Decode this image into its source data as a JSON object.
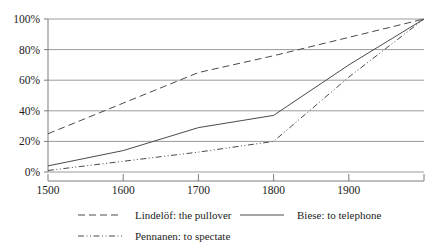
{
  "chart_data": {
    "type": "line",
    "title": "",
    "subtitle": "",
    "xlabel": "",
    "ylabel": "",
    "x": [
      1500,
      1600,
      1700,
      1800,
      1900,
      2000
    ],
    "xlim": [
      1500,
      2000
    ],
    "ylim": [
      0,
      100
    ],
    "grid": true,
    "grid_axis": "y",
    "legend_position": "bottom",
    "xtick_labels": [
      "1500",
      "1600",
      "1700",
      "1800",
      "1900",
      ""
    ],
    "ytick_labels": [
      "0%",
      "20%",
      "40%",
      "60%",
      "80%",
      "100%"
    ],
    "ytick_values": [
      0,
      20,
      40,
      60,
      80,
      100
    ],
    "xtick_values": [
      1500,
      1600,
      1700,
      1800,
      1900,
      2000
    ],
    "series": [
      {
        "name": "Lindelöf: the pullover",
        "style": "dashed",
        "color": "#4a4a4a",
        "values": [
          25,
          45,
          65,
          76,
          88,
          100
        ]
      },
      {
        "name": "Biese: to telephone",
        "style": "solid",
        "color": "#4a4a4a",
        "values": [
          4,
          14,
          29,
          37,
          70,
          100
        ]
      },
      {
        "name": "Pennanen: to spectate",
        "style": "dash-dot-dot",
        "color": "#4a4a4a",
        "values": [
          1,
          7,
          13,
          20,
          62,
          100
        ]
      }
    ]
  },
  "legend": {
    "entries": [
      {
        "label": "Lindelöf: the pullover",
        "style": "dashed"
      },
      {
        "label": "Biese: to telephone",
        "style": "solid"
      },
      {
        "label": "Pennanen: to spectate",
        "style": "dash-dot-dot"
      }
    ]
  },
  "colors": {
    "line": "#4a4a4a",
    "grid": "#9a9a9a",
    "axis": "#7d7d7d",
    "text": "#1d1d1d",
    "background": "#ffffff"
  }
}
